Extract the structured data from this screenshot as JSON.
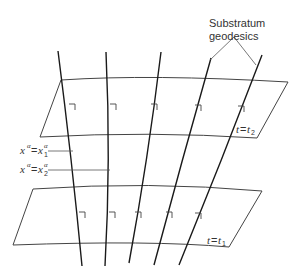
{
  "diagram": {
    "annotation": {
      "line1": "Substratum",
      "line2": "geodesics"
    },
    "planes": [
      {
        "id": "upper",
        "label_var": "t",
        "label_eq": "=",
        "label_val": "t",
        "label_sub": "2"
      },
      {
        "id": "lower",
        "label_var": "t",
        "label_eq": "=",
        "label_val": "t",
        "label_sub": "1"
      }
    ],
    "coordinate_labels": [
      {
        "lhs": "x",
        "lhs_sup": "α",
        "eq": "=",
        "rhs": "x",
        "rhs_sup": "α",
        "rhs_sub": "1"
      },
      {
        "lhs": "x",
        "lhs_sup": "α",
        "eq": "=",
        "rhs": "x",
        "rhs_sup": "α",
        "rhs_sub": "2"
      }
    ],
    "geodesic_count": 5,
    "colors": {
      "line": "#1a1a1a",
      "thin": "#444444",
      "text": "#333333"
    }
  }
}
